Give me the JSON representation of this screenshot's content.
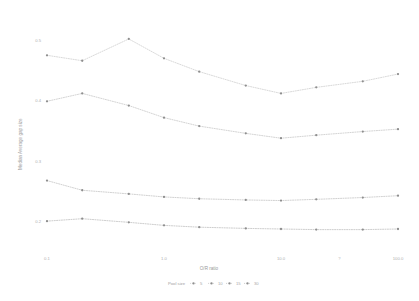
{
  "chart_data": {
    "type": "line",
    "title": "",
    "subtitle": "",
    "xlabel": "O/R ratio",
    "ylabel": "Median Average gap size",
    "xscale": "log",
    "xlim": [
      0.1,
      100.0
    ],
    "ylim": [
      0.15,
      0.53
    ],
    "grid": false,
    "legend_position": "bottom",
    "legend_title": "Pool size",
    "x_ticks": [
      "0.1",
      "1.0",
      "10.0",
      "?",
      "100.0"
    ],
    "x_tick_values": [
      0.1,
      1.0,
      10.0,
      31.6,
      100.0
    ],
    "y_ticks": [
      "0.5",
      "0.4",
      "0.3",
      "0.2"
    ],
    "y_tick_values": [
      0.5,
      0.4,
      0.3,
      0.2
    ],
    "x": [
      0.1,
      0.2,
      0.5,
      1.0,
      2.0,
      5.0,
      10.0,
      20.0,
      50.0,
      100.0
    ],
    "series": [
      {
        "name": "5",
        "color": "#c9c9c9",
        "values": [
          0.475,
          0.466,
          0.502,
          0.47,
          0.448,
          0.425,
          0.412,
          0.422,
          0.432,
          0.444
        ]
      },
      {
        "name": "10",
        "color": "#c2c2c2",
        "values": [
          0.399,
          0.412,
          0.392,
          0.372,
          0.358,
          0.346,
          0.338,
          0.343,
          0.349,
          0.353
        ]
      },
      {
        "name": "15",
        "color": "#bdbdbd",
        "values": [
          0.268,
          0.252,
          0.246,
          0.241,
          0.238,
          0.236,
          0.235,
          0.237,
          0.24,
          0.243
        ]
      },
      {
        "name": "30",
        "color": "#b8b8b8",
        "values": [
          0.201,
          0.205,
          0.199,
          0.194,
          0.191,
          0.189,
          0.188,
          0.187,
          0.187,
          0.188
        ]
      }
    ]
  },
  "axes": {
    "x_title": "O/R ratio",
    "y_title": "Median Average gap size",
    "x_tick_labels": [
      "0.1",
      "1.0",
      "10.0",
      "?",
      "100.0"
    ],
    "y_tick_labels": [
      "0.5",
      "0.4",
      "0.3",
      "0.2"
    ]
  },
  "legend": {
    "title": "Pool size",
    "items": [
      {
        "label": "5"
      },
      {
        "label": "10"
      },
      {
        "label": "15"
      },
      {
        "label": "30"
      }
    ]
  }
}
